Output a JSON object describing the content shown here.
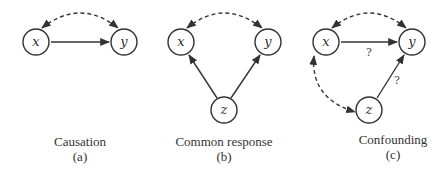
{
  "panels": [
    {
      "caption": "Causation",
      "tag": "(a)",
      "nodes": {
        "x": "x",
        "y": "y"
      }
    },
    {
      "caption": "Common response",
      "tag": "(b)",
      "nodes": {
        "x": "x",
        "y": "y",
        "z": "z"
      }
    },
    {
      "caption": "Confounding",
      "tag": "(c)",
      "nodes": {
        "x": "x",
        "y": "y",
        "z": "z"
      },
      "edge_labels": {
        "x_to_y": "?",
        "z_to_y": "?"
      }
    }
  ],
  "colors": {
    "stroke": "#333333",
    "text": "#333333"
  }
}
